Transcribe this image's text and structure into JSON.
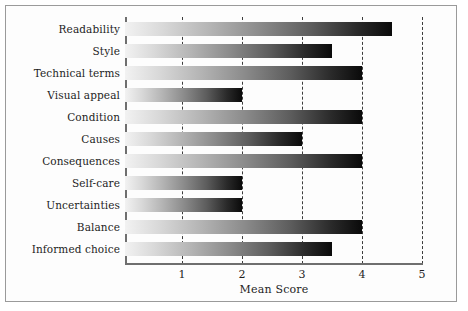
{
  "chart_data": {
    "type": "bar",
    "orientation": "horizontal",
    "title": "",
    "xlabel": "Mean Score",
    "ylabel": "",
    "xlim": [
      0.5,
      5
    ],
    "xticks": [
      "1",
      "2",
      "3",
      "4",
      "5"
    ],
    "xtick_values": [
      1,
      2,
      3,
      4,
      5
    ],
    "grid": "vertical-dashed",
    "legend": "none",
    "categories": [
      "Readability",
      "Style",
      "Technical terms",
      "Visual appeal",
      "Condition",
      "Causes",
      "Consequences",
      "Self-care",
      "Uncertainties",
      "Balance",
      "Informed choice"
    ],
    "values": [
      4.5,
      3.5,
      4.0,
      2.0,
      4.0,
      3.0,
      4.0,
      2.0,
      2.0,
      4.0,
      3.5
    ],
    "bar_fill": "gradient-light-to-dark-grayscale",
    "colors": {
      "bar_start": "#f2f2f2",
      "bar_end": "#0a0a0a",
      "axis": "#6f6f6f",
      "gridline": "#3c3c3c",
      "text": "#1d1d1d",
      "frame": "#9a9a9a",
      "background": "#ffffff"
    }
  }
}
